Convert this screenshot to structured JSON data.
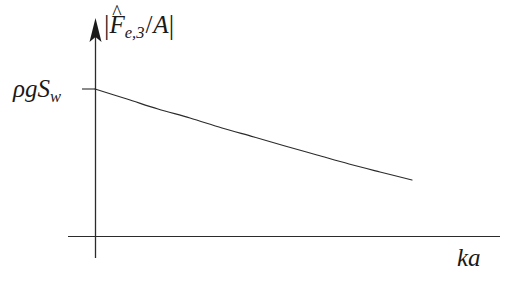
{
  "figure": {
    "background_color": "#ffffff",
    "line_color": "#2b2b2b",
    "width": 514,
    "height": 285
  },
  "labels": {
    "y_axis_title_plain": "|F̂_e,3/A|",
    "y_axis_bar_open": "|",
    "y_axis_bar_close": "|",
    "y_axis_symbol": "F",
    "y_axis_hat": "^",
    "y_axis_subscript_e": "e,",
    "y_axis_subscript_3": "3",
    "y_axis_slash": "/",
    "y_axis_denominator": "A",
    "y_tick_rho": "ρ",
    "y_tick_g": "g",
    "y_tick_S": "S",
    "y_tick_sub_w": "w",
    "y_tick_label_plain": "ρgS_w",
    "x_axis_k": "k",
    "x_axis_a": "a",
    "x_axis_title_plain": "ka"
  },
  "chart_data": {
    "type": "line",
    "title": "",
    "xlabel": "ka",
    "ylabel": "|F̂_e,3/A|",
    "grid": false,
    "legend": null,
    "annotations": [
      {
        "text": "ρgS_w",
        "axis": "y",
        "role": "tick-label",
        "note": "hydrostatic stiffness value at ka = 0"
      }
    ],
    "axes": {
      "x_axis": {
        "arrow": false,
        "tick_labels": [],
        "range_note": "unlabelled, increasing to the right"
      },
      "y_axis": {
        "arrow": true,
        "tick_labels": [
          "ρgS_w"
        ],
        "range_note": "unlabelled magnitude axis"
      }
    },
    "series": [
      {
        "name": "excitation force magnitude",
        "x": [
          0.0,
          0.1,
          0.2,
          0.3,
          0.4,
          0.5,
          0.6,
          0.7,
          0.8,
          0.9,
          1.0
        ],
        "y": [
          1.0,
          0.929,
          0.861,
          0.795,
          0.733,
          0.673,
          0.617,
          0.564,
          0.515,
          0.47,
          0.43
        ],
        "x_pixels": [
          95,
          127,
          158,
          190,
          222,
          254,
          285,
          317,
          349,
          380,
          412
        ],
        "y_pixels": [
          89,
          99,
          109,
          118,
          128,
          137,
          146,
          155,
          164,
          172,
          180
        ],
        "description": "monotonically decreasing, gently convex curve starting at ρgS_w"
      }
    ]
  }
}
